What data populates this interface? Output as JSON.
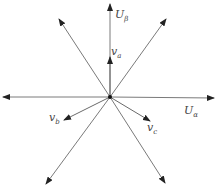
{
  "diagram": {
    "type": "vector-diagram",
    "colors": {
      "line": "#7a7a7a",
      "arrow": "#222222",
      "text": "#444444",
      "background": "#ffffff"
    },
    "origin": [
      110,
      97
    ],
    "axes": [
      {
        "id": "u-beta-axis",
        "tip": [
          110,
          4
        ]
      },
      {
        "id": "u-alpha-axis",
        "tip": [
          214,
          98
        ]
      },
      {
        "id": "neg-alpha-axis",
        "tip": [
          3,
          97
        ]
      },
      {
        "id": "ray-60",
        "tip": [
          166,
          19
        ]
      },
      {
        "id": "ray-120",
        "tip": [
          59,
          19
        ]
      },
      {
        "id": "ray-240",
        "tip": [
          46,
          184
        ]
      },
      {
        "id": "ray-300",
        "tip": [
          165,
          183
        ]
      }
    ],
    "vectors": [
      {
        "id": "v-a",
        "tip": [
          110,
          57
        ]
      },
      {
        "id": "v-b",
        "tip": [
          64,
          120
        ]
      },
      {
        "id": "v-c",
        "tip": [
          150,
          121
        ]
      }
    ],
    "labels": {
      "u_beta": {
        "main": "U",
        "sub": "β"
      },
      "u_alpha": {
        "main": "U",
        "sub": "α"
      },
      "v_a": {
        "main": "v",
        "sub": "a"
      },
      "v_b": {
        "main": "v",
        "sub": "b"
      },
      "v_c": {
        "main": "v",
        "sub": "c"
      }
    }
  }
}
